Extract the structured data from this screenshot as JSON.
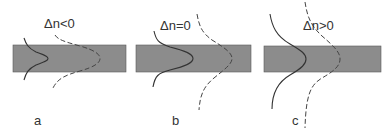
{
  "figure": {
    "panels": [
      {
        "id": "a",
        "caption": "a",
        "condition": "Δn<0"
      },
      {
        "id": "b",
        "caption": "b",
        "condition": "Δn=0"
      },
      {
        "id": "c",
        "caption": "c",
        "condition": "Δn>0"
      }
    ],
    "legend": {
      "solid_curve": "mode profile (solid)",
      "dashed_curve": "mode profile (dashed)"
    },
    "colors": {
      "band": "#8c8c8c",
      "curve": "#333333"
    }
  }
}
